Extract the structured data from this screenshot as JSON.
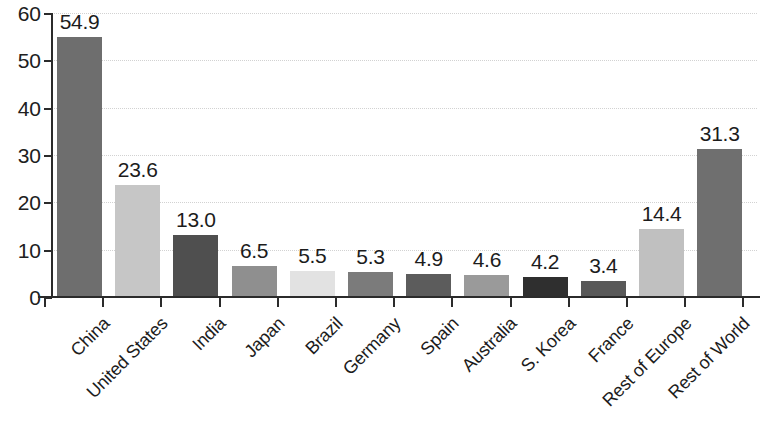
{
  "chart_data": {
    "type": "bar",
    "title": "",
    "subtitle": "",
    "xlabel": "",
    "ylabel": "",
    "categories": [
      "China",
      "United States",
      "India",
      "Japan",
      "Brazil",
      "Germany",
      "Spain",
      "Australia",
      "S. Korea",
      "France",
      "Rest of Europe",
      "Rest of World"
    ],
    "values": [
      54.9,
      23.6,
      13.0,
      6.5,
      5.5,
      5.3,
      4.9,
      4.6,
      4.2,
      3.4,
      14.4,
      31.3
    ],
    "value_labels": [
      "54.9",
      "23.6",
      "13.0",
      "6.5",
      "5.5",
      "5.3",
      "4.9",
      "4.6",
      "4.2",
      "3.4",
      "14.4",
      "31.3"
    ],
    "bar_colors": [
      "#6e6e6e",
      "#c6c6c6",
      "#4f4f4f",
      "#8f8f8f",
      "#e2e2e2",
      "#7b7b7b",
      "#5c5c5c",
      "#9a9a9a",
      "#2f2f2f",
      "#595959",
      "#c0c0c0",
      "#6f6f6f"
    ],
    "ylim": [
      0,
      60
    ],
    "ytick_values": [
      0,
      10,
      20,
      30,
      40,
      50,
      60
    ],
    "ytick_labels": [
      "0",
      "10",
      "20",
      "30",
      "40",
      "50",
      "60"
    ],
    "grid": true,
    "grid_color": "#d2d2d2",
    "axis_color": "#2b2b2b",
    "legend": null,
    "legend_position": "none",
    "category_label_rotation": -45,
    "data_labels_shown": true
  }
}
